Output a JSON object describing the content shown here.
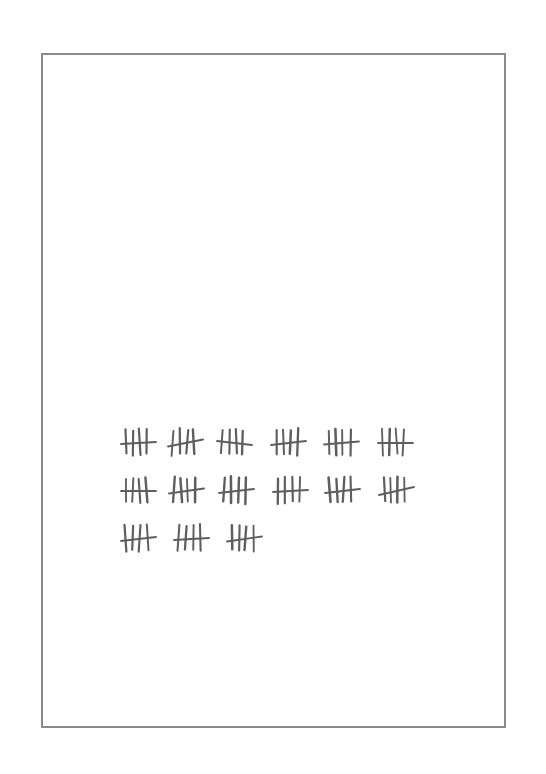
{
  "page": {
    "border_color": "#8a8a8a",
    "ink_color": "#5e5e5e",
    "background": "#ffffff"
  },
  "tally": {
    "group_size": 5,
    "group_count": 15,
    "total_count": 75,
    "rows": [
      {
        "y": 442,
        "groups": [
          {
            "x": 126,
            "cross_tilt": -2
          },
          {
            "x": 173,
            "cross_tilt": -7
          },
          {
            "x": 222,
            "cross_tilt": 4
          },
          {
            "x": 276,
            "cross_tilt": -4
          },
          {
            "x": 329,
            "cross_tilt": -3
          },
          {
            "x": 383,
            "cross_tilt": 0
          }
        ]
      },
      {
        "y": 490,
        "groups": [
          {
            "x": 126,
            "cross_tilt": 0
          },
          {
            "x": 174,
            "cross_tilt": -5
          },
          {
            "x": 224,
            "cross_tilt": -4
          },
          {
            "x": 278,
            "cross_tilt": -2
          },
          {
            "x": 330,
            "cross_tilt": -4
          },
          {
            "x": 384,
            "cross_tilt": -8
          }
        ]
      },
      {
        "y": 538,
        "groups": [
          {
            "x": 126,
            "cross_tilt": -4
          },
          {
            "x": 179,
            "cross_tilt": -2
          },
          {
            "x": 232,
            "cross_tilt": -5
          }
        ]
      }
    ]
  }
}
